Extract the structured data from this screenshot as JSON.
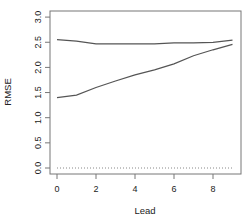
{
  "chart_data": {
    "type": "line",
    "title": "",
    "xlabel": "Lead",
    "ylabel": "RMSE",
    "x": [
      0,
      1,
      2,
      3,
      4,
      5,
      6,
      7,
      8,
      9
    ],
    "xlim": [
      0,
      9
    ],
    "ylim": [
      0.0,
      3.0
    ],
    "xticks": [
      0,
      2,
      4,
      6,
      8
    ],
    "yticks": [
      0.0,
      0.5,
      1.0,
      1.5,
      2.0,
      2.5,
      3.0
    ],
    "xtick_labels": [
      "0",
      "2",
      "4",
      "6",
      "8"
    ],
    "ytick_labels": [
      "0.0",
      "0.5",
      "1.0",
      "1.5",
      "2.0",
      "2.5",
      "3.0"
    ],
    "grid": false,
    "legend": null,
    "series": [
      {
        "name": "upper",
        "color": "#555555",
        "values": [
          2.55,
          2.52,
          2.47,
          2.47,
          2.47,
          2.47,
          2.49,
          2.49,
          2.5,
          2.54
        ]
      },
      {
        "name": "lower",
        "color": "#555555",
        "values": [
          1.4,
          1.45,
          1.6,
          1.73,
          1.85,
          1.95,
          2.07,
          2.23,
          2.35,
          2.46
        ]
      }
    ],
    "reference_line": {
      "y": 0.0,
      "style": "dotted",
      "color": "#888888"
    }
  }
}
